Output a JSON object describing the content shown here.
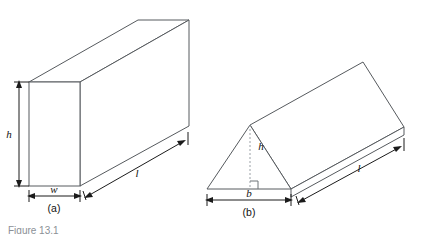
{
  "figure": {
    "background_color": "#ffffff",
    "edge_color": "#565a5e",
    "dimension_color": "#1b1b1b",
    "dashed_color": "#9aa0a6",
    "caption": "Figure 13.1",
    "panels": [
      {
        "id": "a",
        "panel_label": "(a)",
        "shape": "rectangular-prism",
        "labels": {
          "height": "h",
          "width": "w",
          "length": "l"
        }
      },
      {
        "id": "b",
        "panel_label": "(b)",
        "shape": "triangular-prism",
        "labels": {
          "height": "h",
          "base": "b",
          "length": "l"
        }
      }
    ]
  }
}
